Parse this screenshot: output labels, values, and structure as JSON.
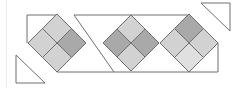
{
  "diagram": {
    "title": "",
    "colors": {
      "outline": "#6e6e6e",
      "light": "#d2d2d2",
      "lighter": "#e0e0e0",
      "dark": "#a9a9a9",
      "background": "#ffffff",
      "frame": "#ececec"
    },
    "diamonds": [
      {
        "cx": 57,
        "cy": 43,
        "r": 29,
        "fills": {
          "top": "light",
          "left": "light",
          "right": "dark",
          "bottom": "light"
        }
      },
      {
        "cx": 131,
        "cy": 43,
        "r": 28,
        "fills": {
          "top": "light",
          "left": "dark",
          "right": "dark",
          "bottom": "light"
        }
      },
      {
        "cx": 189,
        "cy": 43,
        "r": 29,
        "fills": {
          "top": "dark",
          "left": "light",
          "right": "light",
          "bottom": "lighter"
        }
      }
    ],
    "triangles": [
      {
        "name": "top-right-triangle",
        "points": "201,3 230,3 230,31"
      },
      {
        "name": "bottom-left-triangle",
        "points": "16,55 16,83 45,83"
      }
    ]
  }
}
